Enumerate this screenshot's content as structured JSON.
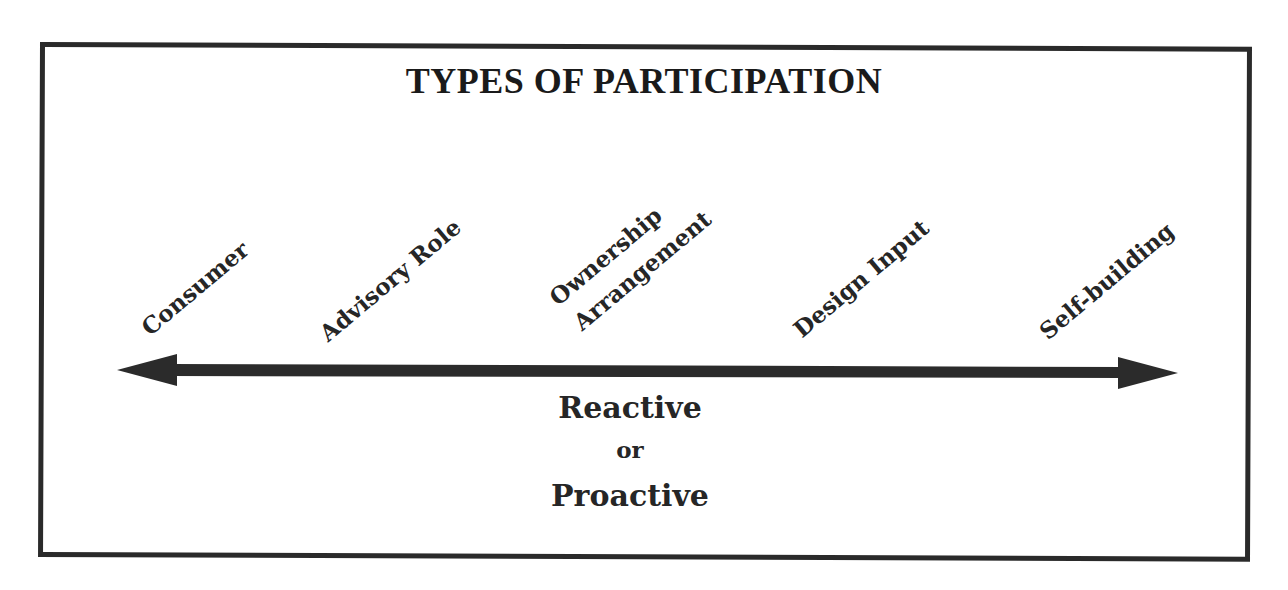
{
  "diagram": {
    "title": "TYPES OF PARTICIPATION",
    "spectrum": {
      "direction": "bidirectional",
      "labels": [
        {
          "id": "consumer",
          "text": "Consumer"
        },
        {
          "id": "advisory-role",
          "text": "Advisory Role"
        },
        {
          "id": "ownership-arrangement",
          "lines": [
            "Ownership",
            "Arrangement"
          ]
        },
        {
          "id": "design-input",
          "text": "Design Input"
        },
        {
          "id": "self-building",
          "text": "Self-building"
        }
      ]
    },
    "caption": {
      "line1": "Reactive",
      "line2": "or",
      "line3": "Proactive"
    },
    "colors": {
      "ink": "#262626",
      "border": "#2a2a2a",
      "arrow": "#2b2b2b",
      "background": "#ffffff"
    }
  }
}
